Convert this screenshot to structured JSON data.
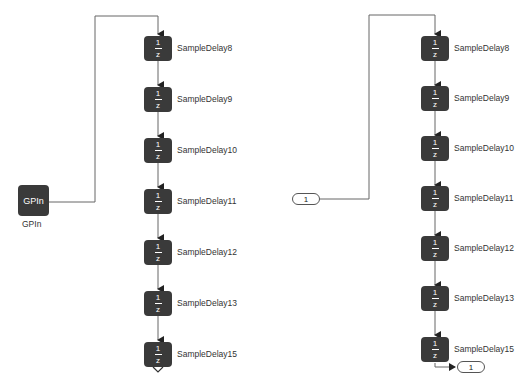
{
  "diagram": {
    "left_subsystem": {
      "source": {
        "type": "GPIn",
        "block_text": "GPIn",
        "label": "GPIn"
      },
      "delays": [
        {
          "name": "SampleDelay8",
          "num": "1",
          "den": "z"
        },
        {
          "name": "SampleDelay9",
          "num": "1",
          "den": "z"
        },
        {
          "name": "SampleDelay10",
          "num": "1",
          "den": "z"
        },
        {
          "name": "SampleDelay11",
          "num": "1",
          "den": "z"
        },
        {
          "name": "SampleDelay12",
          "num": "1",
          "den": "z"
        },
        {
          "name": "SampleDelay13",
          "num": "1",
          "den": "z"
        },
        {
          "name": "SampleDelay15",
          "num": "1",
          "den": "z"
        }
      ],
      "output": "unconnected"
    },
    "right_subsystem": {
      "inport": {
        "label": "1"
      },
      "delays": [
        {
          "name": "SampleDelay8",
          "num": "1",
          "den": "z"
        },
        {
          "name": "SampleDelay9",
          "num": "1",
          "den": "z"
        },
        {
          "name": "SampleDelay10",
          "num": "1",
          "den": "z"
        },
        {
          "name": "SampleDelay11",
          "num": "1",
          "den": "z"
        },
        {
          "name": "SampleDelay12",
          "num": "1",
          "den": "z"
        },
        {
          "name": "SampleDelay13",
          "num": "1",
          "den": "z"
        },
        {
          "name": "SampleDelay15",
          "num": "1",
          "den": "z"
        }
      ],
      "outport": {
        "label": "1"
      }
    },
    "colors": {
      "block_fill": "#3a3a3a",
      "block_text": "#ffffff",
      "wire": "#555555",
      "label_text": "#333333",
      "background": "#ffffff"
    }
  }
}
